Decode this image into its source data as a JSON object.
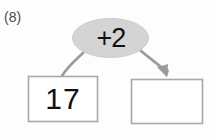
{
  "worksheet": {
    "problem_number": "(8)",
    "type": "function-machine",
    "operation_label": "+2",
    "input_box": {
      "value": "17",
      "filled": true
    },
    "output_box": {
      "value": "",
      "filled": false
    },
    "colors": {
      "background": "#fdfdfd",
      "ellipse_fill": "#d4d4d4",
      "ellipse_stroke": "#c9c9c9",
      "box_stroke": "#a8a8a8",
      "connector": "#9b9b9b",
      "arrow": "#9b9b9b",
      "text": "#111111",
      "problem_number_text": "#4a4a4a"
    },
    "connectors": {
      "input_connector": "curve-no-arrowhead",
      "output_connector": "curve-with-arrowhead"
    }
  }
}
